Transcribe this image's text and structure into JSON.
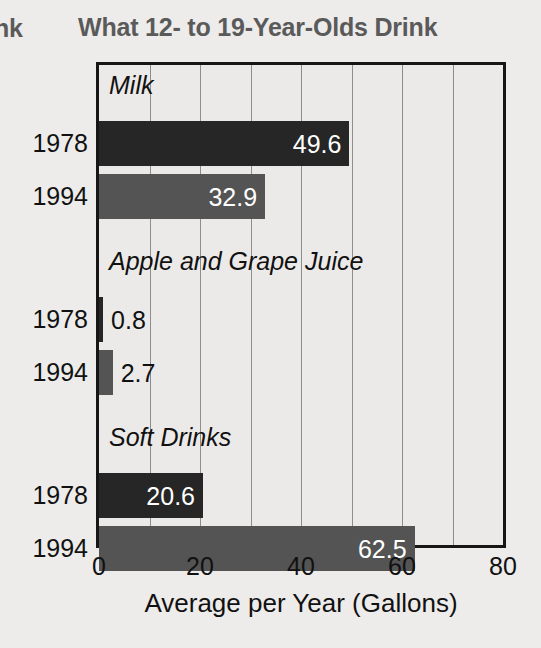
{
  "header": {
    "previous_column_fragment": "nk",
    "title": "What 12- to 19-Year-Olds Drink"
  },
  "axis": {
    "x_title": "Average per Year (Gallons)",
    "x_ticks": [
      "0",
      "20",
      "40",
      "60",
      "80"
    ]
  },
  "colors": {
    "series_1978": "#262626",
    "series_1994": "#545454",
    "plot_background": "#eceae8",
    "page_background": "#edecea",
    "title": "#5a5a5a",
    "axis_line": "#161616",
    "gridline": "#8d8d8d"
  },
  "groups": [
    {
      "label": "Milk",
      "rows": [
        {
          "year": "1978",
          "value": 49.6,
          "value_label": "49.6",
          "series": "1978"
        },
        {
          "year": "1994",
          "value": 32.9,
          "value_label": "32.9",
          "series": "1994"
        }
      ]
    },
    {
      "label": "Apple and Grape Juice",
      "rows": [
        {
          "year": "1978",
          "value": 0.8,
          "value_label": "0.8",
          "series": "1978"
        },
        {
          "year": "1994",
          "value": 2.7,
          "value_label": "2.7",
          "series": "1994"
        }
      ]
    },
    {
      "label": "Soft Drinks",
      "rows": [
        {
          "year": "1978",
          "value": 20.6,
          "value_label": "20.6",
          "series": "1978"
        },
        {
          "year": "1994",
          "value": 62.5,
          "value_label": "62.5",
          "series": "1994"
        }
      ]
    }
  ],
  "chart_data": {
    "type": "bar",
    "orientation": "horizontal",
    "title": "What 12- to 19-Year-Olds Drink",
    "xlabel": "Average per Year (Gallons)",
    "ylabel": "",
    "xlim": [
      0,
      80
    ],
    "xticks": [
      0,
      20,
      40,
      60,
      80
    ],
    "gridlines_x": [
      10,
      20,
      30,
      40,
      50,
      60,
      70
    ],
    "grid": true,
    "legend": "none",
    "categories": [
      "Milk",
      "Apple and Grape Juice",
      "Soft Drinks"
    ],
    "series": [
      {
        "name": "1978",
        "values": [
          49.6,
          0.8,
          20.6
        ],
        "color": "#262626"
      },
      {
        "name": "1994",
        "values": [
          32.9,
          2.7,
          62.5
        ],
        "color": "#545454"
      }
    ],
    "data_labels": [
      "49.6",
      "32.9",
      "0.8",
      "2.7",
      "20.6",
      "62.5"
    ]
  }
}
